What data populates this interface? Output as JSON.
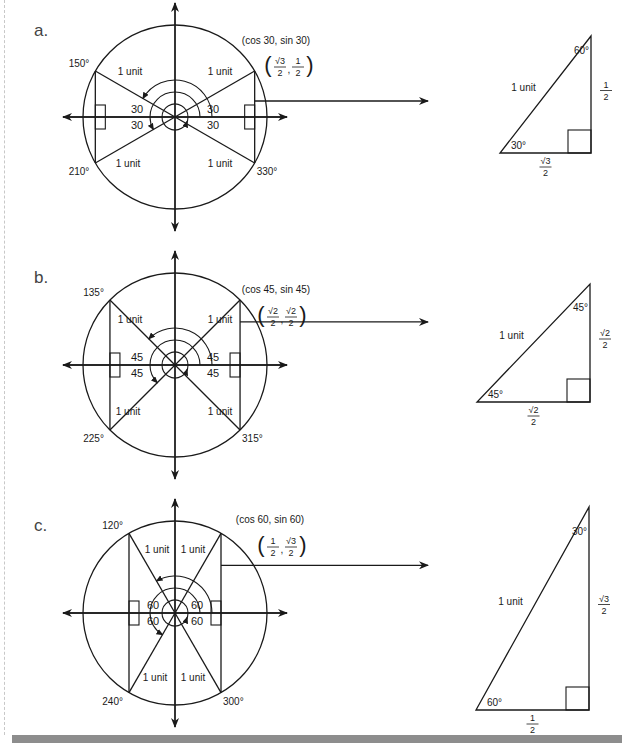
{
  "figure": {
    "diagrams": [
      {
        "letter": "a.",
        "reference_angle": 30,
        "angle_labels": [
          "30",
          "30",
          "30",
          "30"
        ],
        "quadrant_angles": {
          "q2": "150°",
          "q3": "210°",
          "q4": "330°"
        },
        "radius_labels": [
          "1 unit",
          "1 unit",
          "1 unit",
          "1 unit"
        ],
        "coord_label": "(cos 30, sin 30)",
        "coord_value": {
          "x_num": "√3",
          "x_den": "2",
          "y_num": "1",
          "y_den": "2"
        },
        "triangle": {
          "hypotenuse": "1 unit",
          "base_angle": "30°",
          "top_angle": "60°",
          "base": {
            "num": "√3",
            "den": "2"
          },
          "height": {
            "num": "1",
            "den": "2"
          }
        }
      },
      {
        "letter": "b.",
        "reference_angle": 45,
        "angle_labels": [
          "45",
          "45",
          "45",
          "45"
        ],
        "quadrant_angles": {
          "q2": "135°",
          "q3": "225°",
          "q4": "315°"
        },
        "radius_labels": [
          "1 unit",
          "1 unit",
          "1 unit",
          "1 unit"
        ],
        "coord_label": "(cos 45, sin 45)",
        "coord_value": {
          "x_num": "√2",
          "x_den": "2",
          "y_num": "√2",
          "y_den": "2"
        },
        "triangle": {
          "hypotenuse": "1 unit",
          "base_angle": "45°",
          "top_angle": "45°",
          "base": {
            "num": "√2",
            "den": "2"
          },
          "height": {
            "num": "√2",
            "den": "2"
          }
        }
      },
      {
        "letter": "c.",
        "reference_angle": 60,
        "angle_labels": [
          "60",
          "60",
          "60",
          "60"
        ],
        "quadrant_angles": {
          "q2": "120°",
          "q3": "240°",
          "q4": "300°"
        },
        "radius_labels": [
          "1 unit",
          "1 unit",
          "1 unit",
          "1 unit"
        ],
        "coord_label": "(cos 60, sin 60)",
        "coord_value": {
          "x_num": "1",
          "x_den": "2",
          "y_num": "√3",
          "y_den": "2"
        },
        "triangle": {
          "hypotenuse": "1 unit",
          "base_angle": "60°",
          "top_angle": "30°",
          "base": {
            "num": "1",
            "den": "2"
          },
          "height": {
            "num": "√3",
            "den": "2"
          }
        }
      }
    ]
  },
  "colors": {
    "ink": "#1a1a1a",
    "bar": "#8d8d8d",
    "margin": "#c8c8c8"
  }
}
